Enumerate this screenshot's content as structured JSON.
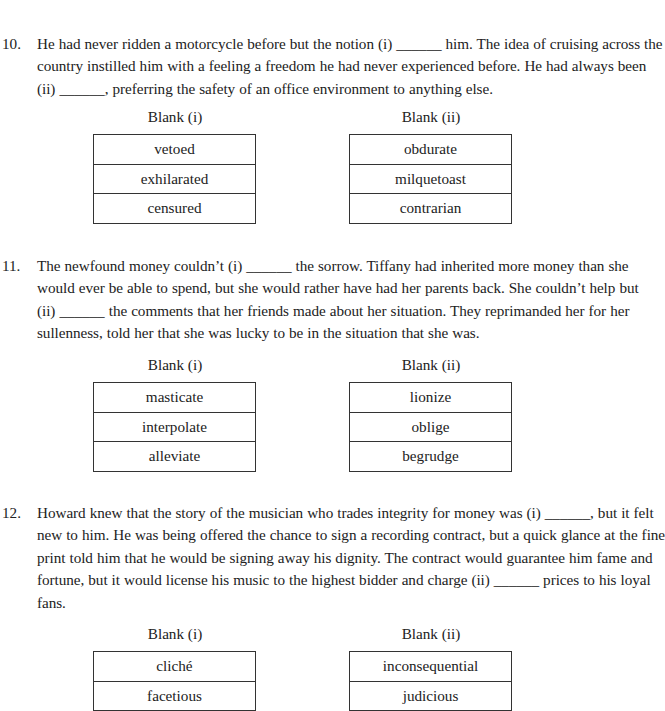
{
  "questions": [
    {
      "number": "10.",
      "lines": [
        "He had never ridden a motorcycle before but the notion (i) ______ him. The idea of cruising across the",
        "country instilled him with a feeling a freedom he had never experienced before. He had always been",
        "(ii) ______, preferring the safety of an office environment to anything else."
      ],
      "blanks": [
        {
          "label": "Blank (i)",
          "choices": [
            "vetoed",
            "exhilarated",
            "censured"
          ]
        },
        {
          "label": "Blank (ii)",
          "choices": [
            "obdurate",
            "milquetoast",
            "contrarian"
          ]
        }
      ]
    },
    {
      "number": "11.",
      "lines": [
        "The newfound money couldn’t (i) ______ the sorrow. Tiffany had inherited more money than she",
        "would ever be able to spend, but she would rather have had her parents back. She couldn’t help but",
        "(ii) ______ the comments that her friends made about her situation. They reprimanded her for her",
        "sullenness, told her that she was lucky to be in the situation that she was."
      ],
      "blanks": [
        {
          "label": "Blank (i)",
          "choices": [
            "masticate",
            "interpolate",
            "alleviate"
          ]
        },
        {
          "label": "Blank (ii)",
          "choices": [
            "lionize",
            "oblige",
            "begrudge"
          ]
        }
      ]
    },
    {
      "number": "12.",
      "lines": [
        "Howard knew that the story of the musician who trades integrity for money was (i) ______, but it felt",
        "new to him. He was being offered the chance to sign a recording contract, but a quick glance at the fine",
        "print told him that he would be signing away his dignity. The contract would guarantee him fame and",
        "fortune, but it would license his music to the highest bidder and charge (ii) ______ prices to his loyal",
        "fans."
      ],
      "blanks": [
        {
          "label": "Blank (i)",
          "choices": [
            "cliché",
            "facetious"
          ]
        },
        {
          "label": "Blank (ii)",
          "choices": [
            "inconsequential",
            "judicious"
          ]
        }
      ]
    }
  ]
}
